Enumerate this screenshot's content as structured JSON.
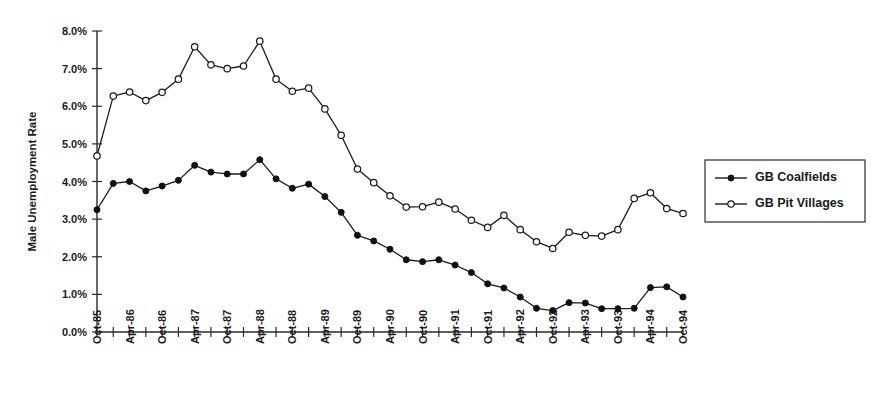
{
  "chart_data": {
    "type": "line",
    "title": "",
    "xlabel": "",
    "ylabel": "Male Unemployment Rate",
    "ylim": [
      0,
      8
    ],
    "ytick_labels": [
      "0.0%",
      "1.0%",
      "2.0%",
      "3.0%",
      "4.0%",
      "5.0%",
      "6.0%",
      "7.0%",
      "8.0%"
    ],
    "ytick_values": [
      0,
      1,
      2,
      3,
      4,
      5,
      6,
      7,
      8
    ],
    "grid": false,
    "legend_position": "right",
    "x": [
      "Oct-85",
      "Jan-86",
      "Apr-86",
      "Jul-86",
      "Oct-86",
      "Jan-87",
      "Apr-87",
      "Jul-87",
      "Oct-87",
      "Jan-88",
      "Apr-88",
      "Jul-88",
      "Oct-88",
      "Jan-89",
      "Apr-89",
      "Jul-89",
      "Oct-89",
      "Jan-90",
      "Apr-90",
      "Jul-90",
      "Oct-90",
      "Jan-91",
      "Apr-91",
      "Jul-91",
      "Oct-91",
      "Jan-92",
      "Apr-92",
      "Jul-92",
      "Oct-92",
      "Jan-93",
      "Apr-93",
      "Jul-93",
      "Oct-93",
      "Jan-94",
      "Apr-94",
      "Jul-94",
      "Oct-94"
    ],
    "xtick_labels": [
      "Oct-85",
      "Apr-86",
      "Oct-86",
      "Apr-87",
      "Oct-87",
      "Apr-88",
      "Oct-88",
      "Apr-89",
      "Oct-89",
      "Apr-90",
      "Oct-90",
      "Apr-91",
      "Oct-91",
      "Apr-92",
      "Oct-92",
      "Apr-93",
      "Oct-93",
      "Apr-94",
      "Oct-94"
    ],
    "xtick_label_every": 2,
    "series": [
      {
        "name": "GB Coalfields",
        "marker": "filled-circle",
        "values": [
          3.25,
          3.95,
          4.0,
          3.75,
          3.88,
          4.03,
          4.43,
          4.25,
          4.2,
          4.2,
          4.58,
          4.07,
          3.82,
          3.93,
          3.6,
          3.18,
          2.57,
          2.42,
          2.2,
          1.92,
          1.87,
          1.92,
          1.78,
          1.58,
          1.28,
          1.17,
          0.93,
          0.63,
          0.57,
          0.78,
          0.77,
          0.62,
          0.62,
          0.63,
          1.18,
          1.2,
          0.93
        ]
      },
      {
        "name": "GB Pit Villages",
        "marker": "open-circle",
        "values": [
          4.68,
          6.27,
          6.38,
          6.15,
          6.37,
          6.72,
          7.58,
          7.1,
          7.0,
          7.07,
          7.73,
          6.72,
          6.4,
          6.48,
          5.93,
          5.23,
          4.33,
          3.97,
          3.62,
          3.32,
          3.33,
          3.45,
          3.27,
          2.97,
          2.78,
          3.1,
          2.72,
          2.4,
          2.22,
          2.65,
          2.57,
          2.55,
          2.72,
          3.55,
          3.7,
          3.28,
          3.15
        ]
      }
    ]
  },
  "legend": {
    "items": [
      {
        "label": "GB Coalfields",
        "marker": "filled-circle"
      },
      {
        "label": "GB Pit Villages",
        "marker": "open-circle"
      }
    ]
  }
}
